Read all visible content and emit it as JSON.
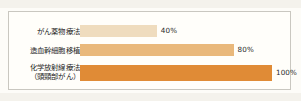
{
  "chart_data": {
    "type": "bar",
    "orientation": "horizontal",
    "title": "",
    "xlabel": "",
    "ylabel": "",
    "xlim": [
      0,
      100
    ],
    "grid": false,
    "legend": null,
    "unit": "%",
    "categories": [
      "がん薬物療法",
      "造血幹細胞移植",
      "化学放射線療法（頭頸部がん）"
    ],
    "values": [
      40,
      80,
      100
    ],
    "value_labels": [
      "40%",
      "80%",
      "100%"
    ],
    "bars": [
      {
        "label_lines": [
          "がん薬物療法"
        ],
        "value": 40,
        "value_label": "40%",
        "color": "#efdcbe"
      },
      {
        "label_lines": [
          "造血幹細胞移植"
        ],
        "value": 80,
        "value_label": "80%",
        "color": "#e9b87b"
      },
      {
        "label_lines": [
          "化学放射線療法",
          "（頭頸部がん）"
        ],
        "value": 100,
        "value_label": "100%",
        "color": "#e08b36"
      }
    ]
  },
  "style": {
    "frame_color": "#c9c7c0",
    "paper_color": "#fffefa",
    "text_color": "#262626"
  }
}
